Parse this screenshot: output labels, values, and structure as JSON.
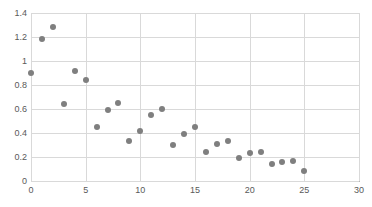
{
  "chart_data": {
    "type": "scatter",
    "title": "",
    "xlabel": "",
    "ylabel": "",
    "xlim": [
      0,
      30
    ],
    "ylim": [
      0,
      1.4
    ],
    "grid": true,
    "legend": "none",
    "marker_color": "#7f7f7f",
    "grid_color": "#d9d9d9",
    "axis_color": "#b7b7b7",
    "xticks": [
      "0",
      "5",
      "10",
      "15",
      "20",
      "25",
      "30"
    ],
    "xtick_values": [
      0,
      5,
      10,
      15,
      20,
      25,
      30
    ],
    "yticks": [
      "0",
      "0.2",
      "0.4",
      "0.6",
      "0.8",
      "1",
      "1.2",
      "1.4"
    ],
    "ytick_values": [
      0,
      0.2,
      0.4,
      0.6,
      0.8,
      1,
      1.2,
      1.4
    ],
    "series": [
      {
        "name": "series-1",
        "points": [
          [
            0,
            0.9
          ],
          [
            1,
            1.18
          ],
          [
            2,
            1.28
          ],
          [
            3,
            0.64
          ],
          [
            4,
            0.92
          ],
          [
            5,
            0.84
          ],
          [
            6,
            0.45
          ],
          [
            7,
            0.59
          ],
          [
            8,
            0.65
          ],
          [
            9,
            0.33
          ],
          [
            10,
            0.42
          ],
          [
            11,
            0.55
          ],
          [
            12,
            0.6
          ],
          [
            13,
            0.3
          ],
          [
            14,
            0.39
          ],
          [
            15,
            0.45
          ],
          [
            16,
            0.24
          ],
          [
            17,
            0.31
          ],
          [
            18,
            0.33
          ],
          [
            19,
            0.19
          ],
          [
            20,
            0.23
          ],
          [
            21,
            0.24
          ],
          [
            22,
            0.14
          ],
          [
            23,
            0.16
          ],
          [
            24,
            0.17
          ],
          [
            25,
            0.08
          ]
        ]
      }
    ]
  }
}
